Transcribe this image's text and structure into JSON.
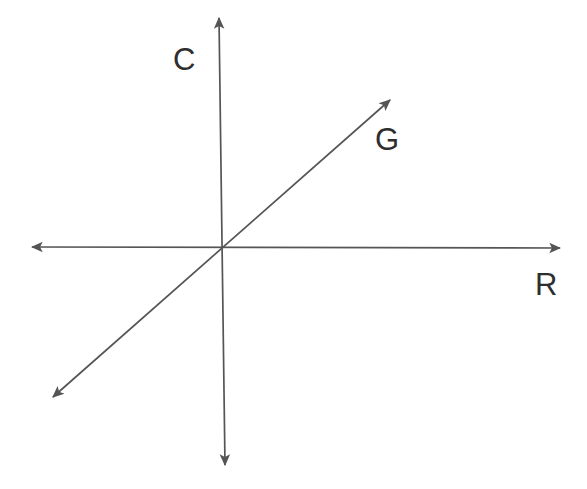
{
  "figure": {
    "background_color": "#ffffff",
    "stroke_color": "#555555",
    "label_color": "#2e2e2e",
    "width": 587,
    "height": 489
  },
  "labels": {
    "vertical_axis": "C",
    "diagonal_axis": "G",
    "horizontal_axis": "R"
  },
  "chart_data": {
    "type": "line",
    "xlabel": "R",
    "ylabel": "C",
    "grid": false,
    "legend": "none",
    "origin": [
      220,
      249
    ],
    "axes": [
      {
        "name": "vertical-axis",
        "label": "C",
        "arrowheads": "both",
        "from": [
          219,
          18
        ],
        "to": [
          225,
          465
        ]
      },
      {
        "name": "horizontal-axis",
        "label": "R",
        "arrowheads": "both",
        "from": [
          32,
          247
        ],
        "to": [
          560,
          248
        ]
      }
    ],
    "series": [
      {
        "name": "G",
        "label": "G",
        "arrowheads": "both",
        "from": [
          53,
          397
        ],
        "to": [
          390,
          100
        ],
        "passes_through_origin": true,
        "slope_sign": "positive"
      }
    ],
    "annotations": [
      {
        "text": "C",
        "x": 185,
        "y": 61
      },
      {
        "text": "G",
        "x": 387,
        "y": 141
      },
      {
        "text": "R",
        "x": 547,
        "y": 287
      }
    ]
  }
}
